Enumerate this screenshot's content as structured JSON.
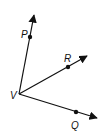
{
  "diagram": {
    "title": "",
    "type": "rays-from-vertex",
    "colors": {
      "stroke": "#111111",
      "background": "#ffffff"
    },
    "vertex": {
      "label": "V",
      "x": 19,
      "y": 94,
      "label_x": 10,
      "label_y": 99
    },
    "rays": [
      {
        "name": "VP",
        "point_label": "P",
        "dot": [
          30,
          37
        ],
        "tip": [
          34,
          15
        ],
        "label_pos": [
          21,
          38
        ]
      },
      {
        "name": "VR",
        "point_label": "R",
        "dot": [
          68,
          67
        ],
        "tip": [
          87,
          56
        ],
        "label_pos": [
          64,
          62
        ]
      },
      {
        "name": "VQ",
        "point_label": "Q",
        "dot": [
          76,
          112
        ],
        "tip": [
          97,
          118
        ],
        "label_pos": [
          71,
          129
        ]
      }
    ],
    "labels": {
      "P": "P",
      "R": "R",
      "V": "V",
      "Q": "Q"
    }
  }
}
